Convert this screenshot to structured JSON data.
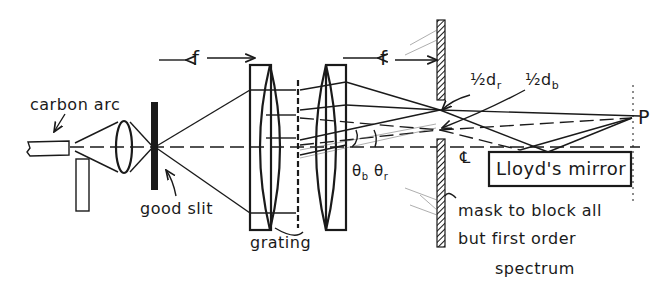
{
  "diagram": {
    "type": "optical setup sketch",
    "labels": {
      "carbon_arc": "carbon arc",
      "good_slit": "good slit",
      "focal_length_1": "f",
      "focal_length_2": "f",
      "grating": "grating",
      "half_dr": "½d",
      "half_dr_sub": "r",
      "half_db": "½d",
      "half_db_sub": "b",
      "theta_b": "θ",
      "theta_b_sub": "b",
      "theta_r": "θ",
      "theta_r_sub": "r",
      "centerline": "℄",
      "lloyds_mirror": "Lloyd's mirror",
      "point_p": "P",
      "mask_line1": "mask to block all",
      "mask_line2": "but first order",
      "mask_line3": "spectrum"
    },
    "components": [
      "carbon arc electrodes",
      "condenser lens",
      "good slit",
      "collimating lens",
      "grating",
      "focusing lens",
      "mask",
      "Lloyd's mirror",
      "observation point P"
    ],
    "colors": {
      "ink": "#1a1a1a",
      "background": "#ffffff"
    }
  }
}
